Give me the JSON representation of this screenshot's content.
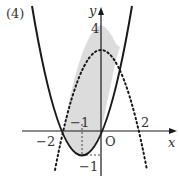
{
  "figure": {
    "label": "(4)",
    "axes": {
      "x_label": "x",
      "y_label": "y",
      "origin_label": "O"
    },
    "ticks": {
      "x_neg2": "−2",
      "x_neg1": "−1",
      "x_pos2": "2",
      "y_pos4": "4",
      "y_neg1": "−1"
    },
    "curves": [
      {
        "name": "solid-parabola",
        "equation": "y = x^2 + 2x",
        "style": "solid",
        "vertex": [
          -1,
          -1
        ],
        "x_intercepts": [
          -2,
          0
        ]
      },
      {
        "name": "dotted-parabola",
        "equation": "y = -x^2 + 4",
        "style": "dotted",
        "vertex": [
          0,
          4
        ],
        "x_intercepts": [
          -2,
          2
        ]
      }
    ],
    "shaded_region": {
      "between": [
        "y = -x^2 + 4",
        "y = x^2 + 2x"
      ],
      "x_range": [
        -2,
        1
      ],
      "color": "#d9d9d9"
    },
    "colors": {
      "stroke": "#1a1a1a",
      "shade": "#dcdcdc"
    }
  }
}
